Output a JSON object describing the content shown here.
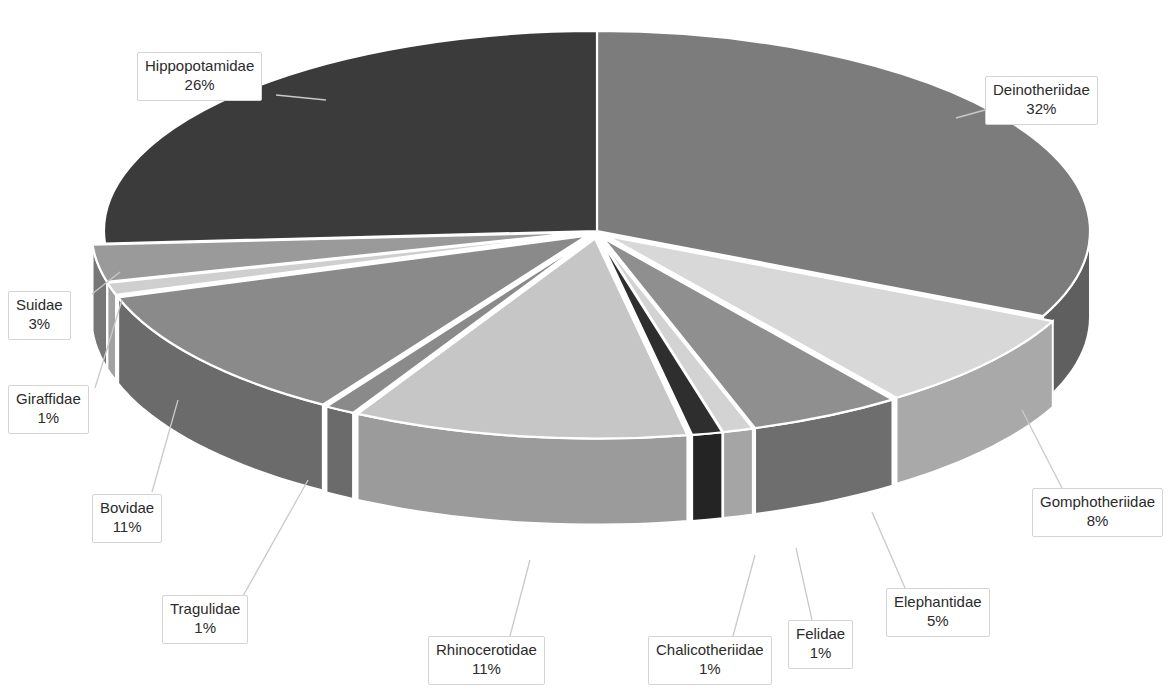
{
  "chart_data": {
    "type": "pie",
    "title": "",
    "subtitle": "",
    "xlabel": "",
    "ylabel": "",
    "style": "3d-exploded-pie",
    "legend_position": "none",
    "data_labels": "category-name-and-percentage",
    "grid": false,
    "categories": [
      "Deinotheriidae",
      "Gomphotheriidae",
      "Elephantidae",
      "Felidae",
      "Chalicotheriidae",
      "Rhinocerotidae",
      "Tragulidae",
      "Bovidae",
      "Giraffidae",
      "Suidae",
      "Hippopotamidae"
    ],
    "values": [
      32,
      8,
      5,
      1,
      1,
      11,
      1,
      11,
      1,
      3,
      26
    ],
    "value_suffix": "%",
    "slices": [
      {
        "label": "Deinotheriidae",
        "percent": 32,
        "percent_text": "32%",
        "color": "#7c7c7c",
        "side_color": "#5f5f5f"
      },
      {
        "label": "Gomphotheriidae",
        "percent": 8,
        "percent_text": "8%",
        "color": "#d8d8d8",
        "side_color": "#a9a9a9"
      },
      {
        "label": "Elephantidae",
        "percent": 5,
        "percent_text": "5%",
        "color": "#8f8f8f",
        "side_color": "#6e6e6e"
      },
      {
        "label": "Felidae",
        "percent": 1,
        "percent_text": "1%",
        "color": "#d3d3d3",
        "side_color": "#a5a5a5"
      },
      {
        "label": "Chalicotheriidae",
        "percent": 1,
        "percent_text": "1%",
        "color": "#2e2e2e",
        "side_color": "#242424"
      },
      {
        "label": "Rhinocerotidae",
        "percent": 11,
        "percent_text": "11%",
        "color": "#c6c6c6",
        "side_color": "#9b9b9b"
      },
      {
        "label": "Tragulidae",
        "percent": 1,
        "percent_text": "1%",
        "color": "#8a8a8a",
        "side_color": "#6b6b6b"
      },
      {
        "label": "Bovidae",
        "percent": 11,
        "percent_text": "11%",
        "color": "#8a8a8a",
        "side_color": "#6b6b6b"
      },
      {
        "label": "Giraffidae",
        "percent": 1,
        "percent_text": "1%",
        "color": "#cfcfcf",
        "side_color": "#a2a2a2"
      },
      {
        "label": "Suidae",
        "percent": 3,
        "percent_text": "3%",
        "color": "#9a9a9a",
        "side_color": "#777777"
      },
      {
        "label": "Hippopotamidae",
        "percent": 26,
        "percent_text": "26%",
        "color": "#3b3b3b",
        "side_color": "#2e2e2e"
      }
    ]
  },
  "labels": [
    {
      "name": "hippopotamidae",
      "text": "Hippopotamidae",
      "percent_text": "26%",
      "x": 137,
      "y": 52,
      "lx1": 276,
      "ly1": 95,
      "lx2": 326,
      "ly2": 100
    },
    {
      "name": "deinotheriidae",
      "text": "Deinotheriidae",
      "percent_text": "32%",
      "x": 985,
      "y": 76,
      "lx1": 985,
      "ly1": 110,
      "lx2": 956,
      "ly2": 118
    },
    {
      "name": "suidae",
      "text": "Suidae",
      "percent_text": "3%",
      "x": 8,
      "y": 291,
      "lx1": 92,
      "ly1": 294,
      "lx2": 120,
      "ly2": 272
    },
    {
      "name": "giraffidae",
      "text": "Giraffidae",
      "percent_text": "1%",
      "x": 8,
      "y": 385,
      "lx1": 95,
      "ly1": 388,
      "lx2": 122,
      "ly2": 300
    },
    {
      "name": "bovidae",
      "text": "Bovidae",
      "percent_text": "11%",
      "x": 92,
      "y": 494,
      "lx1": 152,
      "ly1": 492,
      "lx2": 178,
      "ly2": 400
    },
    {
      "name": "tragulidae",
      "text": "Tragulidae",
      "percent_text": "1%",
      "x": 162,
      "y": 595,
      "lx1": 243,
      "ly1": 596,
      "lx2": 308,
      "ly2": 480
    },
    {
      "name": "rhinocerotidae",
      "text": "Rhinocerotidae",
      "percent_text": "11%",
      "x": 428,
      "y": 636,
      "lx1": 510,
      "ly1": 636,
      "lx2": 530,
      "ly2": 560
    },
    {
      "name": "chalicotheriidae",
      "text": "Chalicotheriidae",
      "percent_text": "1%",
      "x": 648,
      "y": 636,
      "lx1": 733,
      "ly1": 636,
      "lx2": 755,
      "ly2": 555
    },
    {
      "name": "felidae",
      "text": "Felidae",
      "percent_text": "1%",
      "x": 788,
      "y": 620,
      "lx1": 812,
      "ly1": 620,
      "lx2": 796,
      "ly2": 548
    },
    {
      "name": "elephantidae",
      "text": "Elephantidae",
      "percent_text": "5%",
      "x": 886,
      "y": 588,
      "lx1": 905,
      "ly1": 588,
      "lx2": 872,
      "ly2": 512
    },
    {
      "name": "gomphotheriidae",
      "text": "Gomphotheriidae",
      "percent_text": "8%",
      "x": 1032,
      "y": 488,
      "lx1": 1062,
      "ly1": 488,
      "lx2": 1022,
      "ly2": 410
    }
  ]
}
